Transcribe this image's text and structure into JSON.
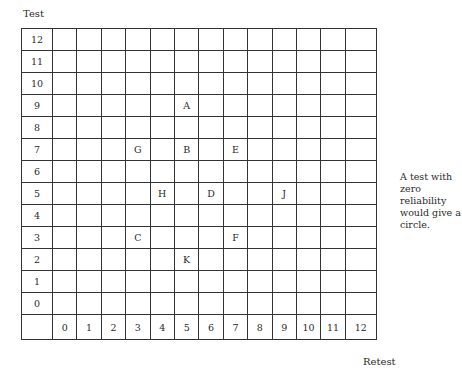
{
  "y_axis_title": "Test",
  "x_axis_title": "Retest",
  "y_ticks": [
    "12",
    "11",
    "10",
    "9",
    "8",
    "7",
    "6",
    "5",
    "4",
    "3",
    "2",
    "1",
    "0"
  ],
  "x_ticks": [
    "0",
    "1",
    "2",
    "3",
    "4",
    "5",
    "6",
    "7",
    "8",
    "9",
    "10",
    "11",
    "12"
  ],
  "note": "A test with zero reliability would give a circle.",
  "points": [
    {
      "label": "A",
      "x": 5,
      "y": 9
    },
    {
      "label": "G",
      "x": 3,
      "y": 7
    },
    {
      "label": "B",
      "x": 5,
      "y": 7
    },
    {
      "label": "E",
      "x": 7,
      "y": 7
    },
    {
      "label": "H",
      "x": 4,
      "y": 5
    },
    {
      "label": "D",
      "x": 6,
      "y": 5
    },
    {
      "label": "J",
      "x": 9,
      "y": 5
    },
    {
      "label": "C",
      "x": 3,
      "y": 3
    },
    {
      "label": "F",
      "x": 7,
      "y": 3
    },
    {
      "label": "K",
      "x": 5,
      "y": 2
    }
  ]
}
